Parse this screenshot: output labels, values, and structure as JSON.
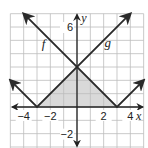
{
  "chart_data": {
    "type": "line",
    "title": "",
    "xlabel": "x",
    "ylabel": "y",
    "xlim": [
      -5,
      5
    ],
    "ylim": [
      -3,
      7
    ],
    "grid": true,
    "x_tick_labels": [
      {
        "value": -4,
        "label": "−4"
      },
      {
        "value": -2,
        "label": "−2"
      },
      {
        "value": 2,
        "label": "2"
      },
      {
        "value": 4,
        "label": "4"
      }
    ],
    "y_tick_labels": [
      {
        "value": 6,
        "label": "6"
      },
      {
        "value": -2,
        "label": "−2"
      }
    ],
    "series": [
      {
        "name": "f",
        "equation": "f(x) = |x − 3|",
        "vertex": [
          3,
          0
        ],
        "points": [
          [
            -4,
            7
          ],
          [
            3,
            0
          ],
          [
            5,
            2
          ]
        ],
        "arrows": "both ends"
      },
      {
        "name": "g",
        "equation": "g(x) = |x + 3|",
        "vertex": [
          -3,
          0
        ],
        "points": [
          [
            -5,
            2
          ],
          [
            -3,
            0
          ],
          [
            4,
            7
          ]
        ],
        "arrows": "both ends"
      }
    ],
    "shaded_region": {
      "description": "Triangle bounded by f, g and the x-axis",
      "vertices": [
        [
          -3,
          0
        ],
        [
          0,
          3
        ],
        [
          3,
          0
        ]
      ],
      "color": "#d9d9d9"
    },
    "annotations": [
      {
        "text": "f",
        "x": -2.5,
        "y": 4.4
      },
      {
        "text": "g",
        "x": 2.3,
        "y": 4.5
      }
    ]
  },
  "colors": {
    "grid": "#bdbdbd",
    "axis": "#222222",
    "curve": "#2a2a2a",
    "shade": "#d9d9d9",
    "background": "#ffffff"
  }
}
